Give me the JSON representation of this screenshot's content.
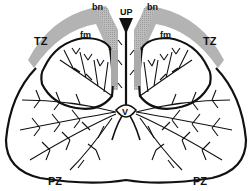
{
  "diagram": {
    "colors": {
      "outline": "#111111",
      "fibromuscular": "#a9a9a9",
      "background": "#ffffff"
    },
    "labels": {
      "urethra_proximal": "UP",
      "bladder_neck_left": "bn",
      "bladder_neck_right": "bn",
      "transition_zone_left": "TZ",
      "transition_zone_right": "TZ",
      "fibromuscular_left": "fm",
      "fibromuscular_right": "fm",
      "sphincter_left": "s",
      "sphincter_right": "s",
      "verumontanum": "V",
      "peripheral_zone_left": "PZ",
      "peripheral_zone_right": "PZ"
    }
  }
}
